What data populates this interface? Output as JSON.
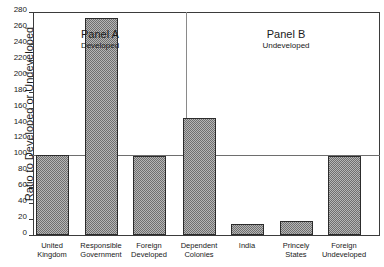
{
  "chart_data": {
    "type": "bar",
    "title": "",
    "xlabel": "",
    "ylabel": "Ratio to Developed or Undeveloped",
    "ylim": [
      0,
      280
    ],
    "ytick_step": 20,
    "yticks": [
      280,
      260,
      240,
      220,
      200,
      180,
      160,
      140,
      120,
      100,
      80,
      60,
      40,
      20,
      0
    ],
    "grid": false,
    "legend": "none",
    "reference_line": 100,
    "categories": [
      "United Kingdom",
      "Responsible Government",
      "Foreign Developed",
      "Dependent Colonies",
      "India",
      "Princely States",
      "Foreign Undeveloped"
    ],
    "values": [
      101,
      273,
      99,
      147,
      14,
      17,
      99
    ],
    "panels": [
      {
        "id": "panel-a",
        "title": "Panel A",
        "subtitle": "Developed",
        "categories": [
          "United Kingdom",
          "Responsible Government",
          "Foreign Developed"
        ],
        "values": [
          101,
          273,
          99
        ]
      },
      {
        "id": "panel-b",
        "title": "Panel B",
        "subtitle": "Undeveloped",
        "categories": [
          "Dependent Colonies",
          "India",
          "Princely States",
          "Foreign Undeveloped"
        ],
        "values": [
          147,
          14,
          17,
          99
        ]
      }
    ],
    "category_labels": [
      {
        "line1": "United",
        "line2": "Kingdom"
      },
      {
        "line1": "Responsible",
        "line2": "Government"
      },
      {
        "line1": "Foreign",
        "line2": "Developed"
      },
      {
        "line1": "Dependent",
        "line2": "Colonies"
      },
      {
        "line1": "India",
        "line2": ""
      },
      {
        "line1": "Princely",
        "line2": "States"
      },
      {
        "line1": "Foreign",
        "line2": "Undeveloped"
      }
    ],
    "colors": {
      "bar_fill": "#b6b6b6",
      "bar_hatch": "#6f6f6f",
      "bar_border": "#2c2c2c",
      "axis": "#3b3b3b",
      "reference_line": "#6e6e6e",
      "divider": "#8a8a8a",
      "text": "#1a1a1a",
      "background": "#ffffff"
    }
  }
}
